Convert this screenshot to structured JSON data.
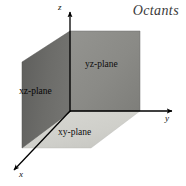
{
  "figure": {
    "title": "Octants",
    "background_color": "#ffffff",
    "axes": [
      {
        "id": "z",
        "label": "z",
        "direction": "up",
        "arrow": true
      },
      {
        "id": "y",
        "label": "y",
        "direction": "right",
        "arrow": true
      },
      {
        "id": "x",
        "label": "x",
        "direction": "down-left",
        "arrow": true
      }
    ],
    "axis_color": "#000000",
    "planes": [
      {
        "id": "yz",
        "label": "yz-plane",
        "fill_color": "#8a8a8a",
        "shape": "rectangle",
        "points": "70,31 140,31 140,111 70,111"
      },
      {
        "id": "xz",
        "label": "xz-plane",
        "fill_color": "#6a6a6a",
        "shape": "parallelogram",
        "points": "22,62 70,31 70,112 22,148"
      },
      {
        "id": "xy",
        "label": "xy-plane",
        "fill_color": "#d0d0cc",
        "shape": "parallelogram",
        "points": "70,111 140,111 91,148 22,148"
      }
    ],
    "origin": {
      "x": 70,
      "y": 111
    }
  }
}
